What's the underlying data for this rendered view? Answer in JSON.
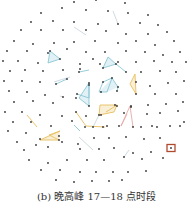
{
  "caption": "(b) 晚高峰 17—18 点时段",
  "colors": {
    "node": "#333333",
    "edge_default": "#c9d6dc",
    "cluster_blue": "#8cc7d6",
    "cluster_orange": "#e8c060",
    "cluster_pink": "#e8a8a8",
    "highlight_box": "#b04a2e"
  },
  "highlight": {
    "x": 171,
    "y": 148
  },
  "nodes": [
    [
      74,
      2
    ],
    [
      96,
      0
    ],
    [
      125,
      3
    ],
    [
      41,
      13
    ],
    [
      62,
      8
    ],
    [
      86,
      10
    ],
    [
      108,
      11
    ],
    [
      128,
      13
    ],
    [
      148,
      15
    ],
    [
      31,
      22
    ],
    [
      53,
      21
    ],
    [
      74,
      22
    ],
    [
      98,
      24
    ],
    [
      118,
      24
    ],
    [
      140,
      23
    ],
    [
      158,
      25
    ],
    [
      21,
      30
    ],
    [
      41,
      30
    ],
    [
      63,
      30
    ],
    [
      86,
      30
    ],
    [
      106,
      31
    ],
    [
      126,
      34
    ],
    [
      148,
      34
    ],
    [
      167,
      32
    ],
    [
      14,
      41
    ],
    [
      33,
      44
    ],
    [
      54,
      43
    ],
    [
      74,
      42
    ],
    [
      95,
      41
    ],
    [
      118,
      43
    ],
    [
      136,
      41
    ],
    [
      155,
      45
    ],
    [
      174,
      41
    ],
    [
      7,
      51
    ],
    [
      27,
      51
    ],
    [
      48,
      53
    ],
    [
      67,
      49
    ],
    [
      86,
      52
    ],
    [
      105,
      52
    ],
    [
      126,
      51
    ],
    [
      145,
      52
    ],
    [
      163,
      55
    ],
    [
      180,
      52
    ],
    [
      3,
      61
    ],
    [
      18,
      61
    ],
    [
      38,
      63
    ],
    [
      50,
      51
    ],
    [
      60,
      59
    ],
    [
      80,
      64
    ],
    [
      100,
      64
    ],
    [
      118,
      62
    ],
    [
      136,
      62
    ],
    [
      154,
      61
    ],
    [
      172,
      62
    ],
    [
      186,
      62
    ],
    [
      10,
      71
    ],
    [
      25,
      70
    ],
    [
      43,
      71
    ],
    [
      63,
      70
    ],
    [
      80,
      69
    ],
    [
      93,
      59
    ],
    [
      103,
      68
    ],
    [
      116,
      64
    ],
    [
      126,
      72
    ],
    [
      141,
      72
    ],
    [
      160,
      71
    ],
    [
      176,
      72
    ],
    [
      4,
      81
    ],
    [
      22,
      81
    ],
    [
      40,
      82
    ],
    [
      56,
      84
    ],
    [
      67,
      79
    ],
    [
      79,
      72
    ],
    [
      89,
      83
    ],
    [
      103,
      82
    ],
    [
      112,
      78
    ],
    [
      118,
      87
    ],
    [
      136,
      82
    ],
    [
      150,
      86
    ],
    [
      168,
      83
    ],
    [
      184,
      81
    ],
    [
      9,
      91
    ],
    [
      27,
      92
    ],
    [
      45,
      95
    ],
    [
      63,
      97
    ],
    [
      77,
      94
    ],
    [
      89,
      85
    ],
    [
      101,
      92
    ],
    [
      117,
      91
    ],
    [
      136,
      94
    ],
    [
      155,
      94
    ],
    [
      176,
      94
    ],
    [
      14,
      102
    ],
    [
      33,
      101
    ],
    [
      53,
      103
    ],
    [
      76,
      98
    ],
    [
      89,
      106
    ],
    [
      99,
      115
    ],
    [
      115,
      105
    ],
    [
      131,
      106
    ],
    [
      148,
      105
    ],
    [
      166,
      104
    ],
    [
      183,
      102
    ],
    [
      5,
      112
    ],
    [
      22,
      112
    ],
    [
      40,
      115
    ],
    [
      62,
      116
    ],
    [
      76,
      112
    ],
    [
      93,
      127
    ],
    [
      107,
      126
    ],
    [
      117,
      106
    ],
    [
      131,
      107
    ],
    [
      147,
      114
    ],
    [
      160,
      113
    ],
    [
      178,
      111
    ],
    [
      13,
      122
    ],
    [
      31,
      122
    ],
    [
      51,
      126
    ],
    [
      72,
      121
    ],
    [
      86,
      116
    ],
    [
      101,
      115
    ],
    [
      124,
      113
    ],
    [
      133,
      127
    ],
    [
      152,
      126
    ],
    [
      170,
      126
    ],
    [
      184,
      122
    ],
    [
      8,
      131
    ],
    [
      26,
      133
    ],
    [
      40,
      139
    ],
    [
      59,
      136
    ],
    [
      85,
      127
    ],
    [
      103,
      127
    ],
    [
      119,
      126
    ],
    [
      141,
      127
    ],
    [
      157,
      127
    ],
    [
      180,
      126
    ],
    [
      17,
      142
    ],
    [
      36,
      145
    ],
    [
      59,
      140
    ],
    [
      78,
      144
    ],
    [
      94,
      138
    ],
    [
      109,
      138
    ],
    [
      126,
      137
    ],
    [
      144,
      139
    ],
    [
      160,
      138
    ],
    [
      24,
      150
    ],
    [
      48,
      147
    ],
    [
      62,
      142
    ],
    [
      80,
      149
    ],
    [
      99,
      149
    ],
    [
      114,
      148
    ],
    [
      133,
      153
    ],
    [
      151,
      152
    ],
    [
      171,
      148
    ],
    [
      29,
      160
    ],
    [
      48,
      163
    ],
    [
      67,
      160
    ],
    [
      87,
      160
    ],
    [
      104,
      160
    ],
    [
      124,
      157
    ],
    [
      142,
      159
    ],
    [
      163,
      158
    ],
    [
      41,
      170
    ],
    [
      60,
      170
    ],
    [
      80,
      172
    ],
    [
      96,
      172
    ],
    [
      113,
      172
    ],
    [
      128,
      172
    ],
    [
      146,
      171
    ],
    [
      56,
      180
    ],
    [
      74,
      182
    ],
    [
      92,
      181
    ],
    [
      109,
      181
    ],
    [
      122,
      180
    ]
  ],
  "edges": {
    "blue": [
      [
        [
          50,
          51
        ],
        [
          60,
          59
        ]
      ],
      [
        [
          50,
          51
        ],
        [
          48,
          63
        ]
      ],
      [
        [
          48,
          63
        ],
        [
          60,
          59
        ]
      ],
      [
        [
          108,
          57
        ],
        [
          116,
          64
        ]
      ],
      [
        [
          108,
          57
        ],
        [
          103,
          68
        ]
      ],
      [
        [
          103,
          68
        ],
        [
          116,
          64
        ]
      ],
      [
        [
          116,
          64
        ],
        [
          126,
          72
        ]
      ],
      [
        [
          89,
          83
        ],
        [
          79,
          98
        ]
      ],
      [
        [
          89,
          83
        ],
        [
          89,
          106
        ]
      ],
      [
        [
          79,
          98
        ],
        [
          89,
          106
        ]
      ],
      [
        [
          89,
          83
        ],
        [
          89,
          98
        ]
      ],
      [
        [
          112,
          78
        ],
        [
          103,
          82
        ]
      ],
      [
        [
          112,
          78
        ],
        [
          118,
          87
        ]
      ],
      [
        [
          103,
          82
        ],
        [
          99,
          92
        ]
      ],
      [
        [
          112,
          78
        ],
        [
          107,
          92
        ]
      ],
      [
        [
          99,
          92
        ],
        [
          107,
          92
        ]
      ],
      [
        [
          118,
          87
        ],
        [
          117,
          91
        ]
      ],
      [
        [
          79,
          72
        ],
        [
          89,
          70
        ]
      ],
      [
        [
          56,
          84
        ],
        [
          67,
          79
        ]
      ],
      [
        [
          77,
          94
        ],
        [
          89,
          98
        ]
      ],
      [
        [
          74,
          125
        ],
        [
          80,
          131
        ]
      ]
    ],
    "orange": [
      [
        [
          135,
          74
        ],
        [
          130,
          84
        ]
      ],
      [
        [
          135,
          74
        ],
        [
          136,
          94
        ]
      ],
      [
        [
          130,
          84
        ],
        [
          136,
          94
        ]
      ],
      [
        [
          100,
          105
        ],
        [
          117,
          105
        ]
      ],
      [
        [
          100,
          105
        ],
        [
          99,
          115
        ]
      ],
      [
        [
          99,
          115
        ],
        [
          114,
          112
        ]
      ],
      [
        [
          114,
          112
        ],
        [
          117,
          105
        ]
      ],
      [
        [
          106,
          112
        ],
        [
          117,
          105
        ]
      ],
      [
        [
          40,
          140
        ],
        [
          60,
          131
        ]
      ],
      [
        [
          40,
          140
        ],
        [
          59,
          140
        ]
      ],
      [
        [
          49,
          135
        ],
        [
          59,
          140
        ]
      ],
      [
        [
          49,
          135
        ],
        [
          60,
          131
        ]
      ],
      [
        [
          76,
          112
        ],
        [
          86,
          126
        ]
      ],
      [
        [
          86,
          126
        ],
        [
          105,
          127
        ]
      ],
      [
        [
          27,
          115
        ],
        [
          37,
          127
        ]
      ]
    ],
    "pink": [
      [
        [
          130,
          106
        ],
        [
          121,
          126
        ]
      ],
      [
        [
          130,
          106
        ],
        [
          133,
          127
        ]
      ],
      [
        [
          127,
          114
        ],
        [
          121,
          126
        ]
      ]
    ],
    "grey": [
      [
        [
          74,
          27
        ],
        [
          86,
          35
        ]
      ],
      [
        [
          113,
          11
        ],
        [
          118,
          24
        ]
      ],
      [
        [
          54,
          82
        ],
        [
          70,
          77
        ]
      ],
      [
        [
          93,
          127
        ],
        [
          99,
          115
        ]
      ],
      [
        [
          79,
          137
        ],
        [
          93,
          150
        ]
      ],
      [
        [
          124,
          157
        ],
        [
          129,
          150
        ]
      ],
      [
        [
          60,
          96
        ],
        [
          63,
          97
        ]
      ]
    ]
  }
}
